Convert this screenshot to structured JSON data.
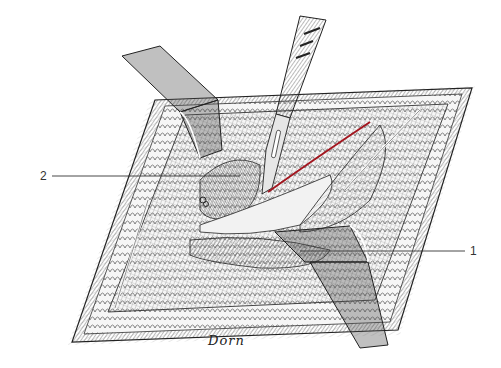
{
  "figure": {
    "labels": [
      {
        "id": "1",
        "text": "1",
        "x": 470,
        "y": 245,
        "line": {
          "x1": 300,
          "y1": 251,
          "x2": 465,
          "y2": 251
        }
      },
      {
        "id": "2",
        "text": "2",
        "x": 40,
        "y": 170,
        "line": {
          "x1": 52,
          "y1": 176,
          "x2": 240,
          "y2": 176
        }
      }
    ],
    "signature": {
      "text": "Dorn",
      "x": 208,
      "y": 333
    },
    "colors": {
      "ink": "#2a2a2a",
      "hatch": "#6e6e6e",
      "light_hatch": "#b5b5b5",
      "incision": "#a3161f",
      "paper": "#ffffff",
      "fat_lobule": "#f4f4f4"
    },
    "elements": {
      "retractor_upper": "upper-left retractor",
      "retractor_lower": "lower-right retractor",
      "scalpel": "scalpel",
      "incision": "red incision line"
    }
  }
}
